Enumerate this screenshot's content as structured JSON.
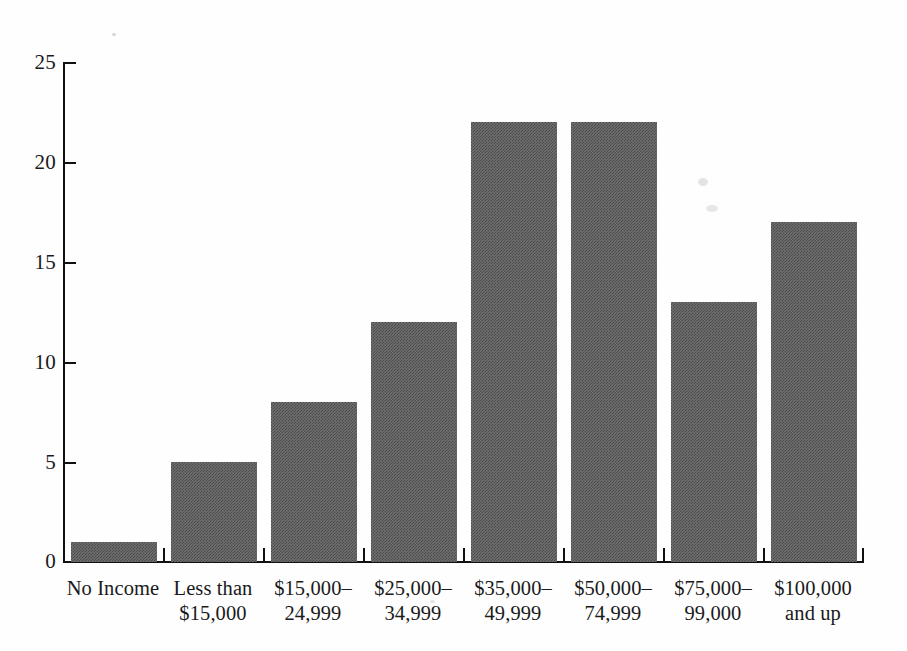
{
  "chart_data": {
    "type": "bar",
    "title": "",
    "subtitle": "",
    "xlabel": "",
    "ylabel": "",
    "categories": [
      "No Income",
      "Less than\n$15,000",
      "$15,000–\n24,999",
      "$25,000–\n34,999",
      "$35,000–\n49,999",
      "$50,000–\n74,999",
      "$75,000–\n99,000",
      "$100,000\nand up"
    ],
    "values": [
      1,
      5,
      8,
      12,
      22,
      22,
      13,
      17
    ],
    "ylim": [
      0,
      25
    ],
    "yticks": [
      0,
      5,
      10,
      15,
      20,
      25
    ],
    "ytick_labels": [
      "0",
      "5",
      "10",
      "15",
      "20",
      "25"
    ],
    "grid": false,
    "legend": null,
    "bar_color": "#6f6f6f",
    "axis_color": "#111111"
  },
  "axis": {
    "y_tick_labels": [
      "25",
      "20",
      "15",
      "10",
      "5",
      "0"
    ]
  },
  "bars": [
    {
      "label": "No Income",
      "value": 1
    },
    {
      "label": "Less than $15,000",
      "value": 5
    },
    {
      "label": "$15,000–24,999",
      "value": 8
    },
    {
      "label": "$25,000–34,999",
      "value": 12
    },
    {
      "label": "$35,000–49,999",
      "value": 22
    },
    {
      "label": "$50,000–74,999",
      "value": 22
    },
    {
      "label": "$75,000–99,000",
      "value": 13
    },
    {
      "label": "$100,000 and up",
      "value": 17
    }
  ]
}
